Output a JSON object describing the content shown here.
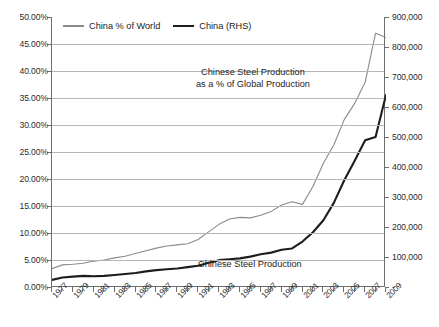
{
  "chart_data": {
    "type": "line",
    "title": "",
    "xlabel": "",
    "ylabel": "",
    "grid": true,
    "legend_position": "top-left-inside",
    "x": [
      1977,
      1978,
      1979,
      1980,
      1981,
      1982,
      1983,
      1984,
      1985,
      1986,
      1987,
      1988,
      1989,
      1990,
      1991,
      1992,
      1993,
      1994,
      1995,
      1996,
      1997,
      1998,
      1999,
      2000,
      2001,
      2002,
      2003,
      2004,
      2005,
      2006,
      2007,
      2008,
      2009
    ],
    "xtick_labels": [
      "1977",
      "1979",
      "1981",
      "1983",
      "1985",
      "1987",
      "1989",
      "1991",
      "1993",
      "1995",
      "1997",
      "1999",
      "2001",
      "2003",
      "2005",
      "2007",
      "2009"
    ],
    "axes": {
      "left": {
        "label": "",
        "ylim": [
          0,
          50
        ],
        "unit": "%",
        "tick_labels": [
          "0.00%",
          "5.00%",
          "10.00%",
          "15.00%",
          "20.00%",
          "25.00%",
          "30.00%",
          "35.00%",
          "40.00%",
          "45.00%",
          "50.00%"
        ],
        "tick_values": [
          0,
          5,
          10,
          15,
          20,
          25,
          30,
          35,
          40,
          45,
          50
        ]
      },
      "right": {
        "label": "",
        "ylim": [
          0,
          900000
        ],
        "unit": "thousand tonnes",
        "tick_labels": [
          "-",
          "100,000",
          "200,000",
          "300,000",
          "400,000",
          "500,000",
          "600,000",
          "700,000",
          "800,000",
          "900,000"
        ],
        "tick_values": [
          0,
          100000,
          200000,
          300000,
          400000,
          500000,
          600000,
          700000,
          800000,
          900000
        ]
      }
    },
    "series": [
      {
        "name": "China % of World",
        "axis": "left",
        "color": "#8b8b8b",
        "width": 1.1,
        "unit": "%",
        "values": [
          3.4,
          4.1,
          4.2,
          4.4,
          4.8,
          5.0,
          5.4,
          5.7,
          6.2,
          6.7,
          7.2,
          7.6,
          7.8,
          8.0,
          8.8,
          10.2,
          11.6,
          12.6,
          12.9,
          12.8,
          13.3,
          14.0,
          15.2,
          15.8,
          15.3,
          18.6,
          22.9,
          26.3,
          31.0,
          34.0,
          37.9,
          47.0,
          46.2
        ]
      },
      {
        "name": "China (RHS)",
        "axis": "right",
        "color": "#1d1d1d",
        "width": 2.1,
        "unit": "thousand tonnes",
        "values": [
          23700,
          31800,
          34500,
          37100,
          35600,
          37200,
          40200,
          43400,
          46800,
          52200,
          56300,
          59400,
          61600,
          66300,
          71000,
          80900,
          89500,
          92600,
          95400,
          101200,
          108900,
          114600,
          123900,
          128500,
          151600,
          182400,
          222300,
          280500,
          355800,
          421000,
          489000,
          500300,
          640000
        ]
      }
    ],
    "annotations": [
      {
        "name": "percent-series-annotation",
        "text_lines": [
          "Chinese Steel Production",
          "as a % of Global Production"
        ]
      },
      {
        "name": "absolute-series-annotation",
        "text_lines": [
          "Chinese Steel Production"
        ]
      }
    ],
    "caption": ""
  },
  "legend": {
    "items": [
      {
        "label": "China % of World",
        "style": "thin-gray"
      },
      {
        "label": "China (RHS)",
        "style": "thick-black"
      }
    ]
  },
  "annotations": {
    "percent": {
      "line1": "Chinese Steel Production",
      "line2": "as a % of Global Production"
    },
    "absolute": {
      "line1": "Chinese Steel Production"
    }
  },
  "colors": {
    "percent_series": "#8b8b8b",
    "absolute_series": "#1d1d1d",
    "gridline": "#b6b6b6",
    "axis": "#6e6e6e",
    "text": "#222222",
    "background": "#ffffff"
  }
}
